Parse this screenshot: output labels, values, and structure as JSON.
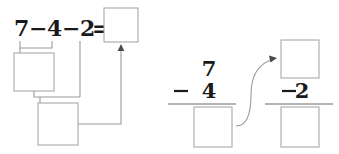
{
  "worksheet": {
    "title": "Subtraction decomposition worksheet",
    "left_panel": {
      "name": "horizontal-equation-panel",
      "equation": {
        "first_operand": "7",
        "first_minus": "−",
        "second_operand": "4",
        "second_minus": "−",
        "third_operand": "2",
        "equals": "=",
        "full_text": "7−4−2="
      },
      "answer_box": {
        "name": "final-answer-box",
        "value": ""
      },
      "step1_box": {
        "name": "step-one-answer-box",
        "value": ""
      },
      "step2_box": {
        "name": "step-two-answer-box",
        "value": ""
      }
    },
    "right_panel": {
      "name": "vertical-subtraction-panel",
      "column_one": {
        "name": "first-vertical-subtraction",
        "minuend": "7",
        "operator": "−",
        "subtrahend": "4",
        "result_box": {
          "name": "first-column-result-box",
          "value": ""
        }
      },
      "column_two": {
        "name": "second-vertical-subtraction",
        "minuend_box": {
          "name": "second-column-minuend-box",
          "value": ""
        },
        "operator": "−",
        "subtrahend": "2",
        "result_box": {
          "name": "second-column-result-box",
          "value": ""
        }
      }
    },
    "colors": {
      "ink": "#1a1a1a",
      "box_stroke": "#a8a8a8",
      "connector": "#9a9a9a",
      "rule": "#6b6b6b",
      "background": "#ffffff"
    }
  }
}
